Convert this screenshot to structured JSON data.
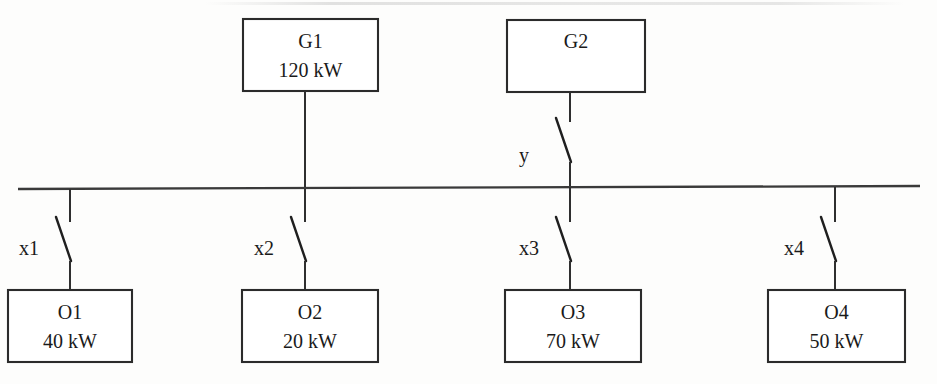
{
  "diagram": {
    "type": "single-line-electrical-diagram",
    "title": "",
    "colors": {
      "line": "#2f2f2f",
      "box_stroke": "#2b2b2b",
      "text": "#1a1a1a",
      "background": "#fdfdfc"
    },
    "sources": [
      {
        "id": "G1",
        "label": "G1",
        "rating": "120 kW",
        "box": {
          "x": 243,
          "y": 19,
          "w": 135,
          "h": 72
        },
        "drop_x": 305,
        "has_switch": false,
        "switch_label": ""
      },
      {
        "id": "G2",
        "label": "G2",
        "rating": "",
        "box": {
          "x": 507,
          "y": 20,
          "w": 138,
          "h": 72
        },
        "drop_x": 570,
        "has_switch": true,
        "switch_label": "y"
      }
    ],
    "busbar": {
      "name": "main-bus",
      "x1": 18,
      "y1": 189,
      "x2": 920,
      "y2": 186
    },
    "loads": [
      {
        "id": "O1",
        "label": "O1",
        "rating": "40 kW",
        "switch_label": "x1",
        "box": {
          "x": 8,
          "y": 290,
          "w": 124,
          "h": 72
        },
        "drop_x": 70
      },
      {
        "id": "O2",
        "label": "O2",
        "rating": "20 kW",
        "switch_label": "x2",
        "box": {
          "x": 242,
          "y": 290,
          "w": 136,
          "h": 72
        },
        "drop_x": 305
      },
      {
        "id": "O3",
        "label": "O3",
        "rating": "70 kW",
        "switch_label": "x3",
        "box": {
          "x": 505,
          "y": 290,
          "w": 136,
          "h": 72
        },
        "drop_x": 570
      },
      {
        "id": "O4",
        "label": "O4",
        "rating": "50 kW",
        "switch_label": "x4",
        "box": {
          "x": 768,
          "y": 290,
          "w": 137,
          "h": 72
        },
        "drop_x": 835
      }
    ]
  }
}
